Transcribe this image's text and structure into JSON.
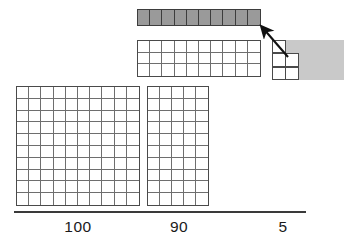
{
  "figure": {
    "total": 195,
    "colors": {
      "grid_line": "#6e6e6e",
      "grid_border": "#4a4a4a",
      "ten_strip_fill": "#9a9a9a",
      "shade_fill": "#c9c9c9",
      "baseline": "#3a3a3a",
      "text": "#1a1a1a"
    }
  },
  "blocks": {
    "ten_strip": {
      "name": "ten-strip",
      "columns": 10,
      "rows": 1,
      "cells": 10,
      "filled": true
    },
    "mid_grid": {
      "name": "thirty-grid",
      "columns": 10,
      "rows": 3,
      "cells": 30,
      "filled": false
    },
    "hundred": {
      "name": "hundred-grid",
      "columns": 10,
      "rows": 10,
      "cells": 100,
      "filled": false
    },
    "ninety": {
      "name": "ninety-grid",
      "columns": 5,
      "rows": 10,
      "cells": 50,
      "filled": false
    },
    "five": {
      "name": "five-unit-piece",
      "cells": 5,
      "filled": false
    }
  },
  "arrow": {
    "name": "callout-arrow",
    "from": "five-unit-piece",
    "to": "ten-strip"
  },
  "labels": {
    "hundreds": "100",
    "tens": "90",
    "ones": "5"
  },
  "chart_data": {
    "type": "bar",
    "categories": [
      "100",
      "90",
      "5"
    ],
    "values": [
      100,
      90,
      5
    ],
    "title": "",
    "xlabel": "",
    "ylabel": "",
    "ylim": [
      0,
      100
    ],
    "grid": true,
    "legend": "none",
    "annotations": [
      "10-unit strip shaded",
      "arrow from 5-unit piece to 10-strip"
    ]
  }
}
